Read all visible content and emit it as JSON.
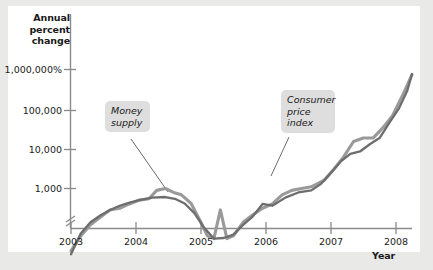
{
  "figure": {
    "background": "#e9e9e7",
    "plot_background": "#ffffff"
  },
  "chart_data": {
    "type": "line",
    "title": "",
    "xlabel": "Year",
    "ylabel": "Annual percent change",
    "y_scale": "log",
    "y_axis_break": true,
    "grid": false,
    "legend_position": "inline-callouts",
    "x_tick_labels": [
      "2003",
      "2004",
      "2005",
      "2006",
      "2007",
      "2008"
    ],
    "x_tick_values": [
      2003,
      2004,
      2005,
      2006,
      2007,
      2008
    ],
    "y_tick_labels": [
      "1,000,000%",
      "100,000",
      "10,000",
      "1,000"
    ],
    "y_tick_values": [
      1000000,
      100000,
      10000,
      1000
    ],
    "xlim": [
      2003,
      2008.25
    ],
    "ylim": [
      10,
      1000000
    ],
    "series": [
      {
        "name": "Money supply",
        "color": "#9a9a9a",
        "points": [
          [
            2003.0,
            30
          ],
          [
            2003.15,
            70
          ],
          [
            2003.3,
            130
          ],
          [
            2003.45,
            200
          ],
          [
            2003.6,
            300
          ],
          [
            2003.75,
            330
          ],
          [
            2003.9,
            420
          ],
          [
            2004.05,
            520
          ],
          [
            2004.2,
            560
          ],
          [
            2004.32,
            900
          ],
          [
            2004.45,
            1000
          ],
          [
            2004.58,
            800
          ],
          [
            2004.7,
            700
          ],
          [
            2004.85,
            430
          ],
          [
            2005.0,
            150
          ],
          [
            2005.1,
            70
          ],
          [
            2005.2,
            60
          ],
          [
            2005.3,
            300
          ],
          [
            2005.4,
            60
          ],
          [
            2005.5,
            70
          ],
          [
            2005.65,
            150
          ],
          [
            2005.8,
            230
          ],
          [
            2005.95,
            330
          ],
          [
            2006.1,
            420
          ],
          [
            2006.25,
            700
          ],
          [
            2006.4,
            900
          ],
          [
            2006.55,
            1000
          ],
          [
            2006.7,
            1100
          ],
          [
            2006.9,
            1600
          ],
          [
            2007.05,
            3000
          ],
          [
            2007.2,
            6000
          ],
          [
            2007.35,
            14000
          ],
          [
            2007.5,
            17000
          ],
          [
            2007.65,
            17000
          ],
          [
            2007.8,
            30000
          ],
          [
            2007.95,
            60000
          ],
          [
            2008.1,
            180000
          ],
          [
            2008.25,
            600000
          ]
        ]
      },
      {
        "name": "Consumer price index",
        "color": "#6d6d6d",
        "points": [
          [
            2003.0,
            25
          ],
          [
            2003.15,
            80
          ],
          [
            2003.3,
            150
          ],
          [
            2003.45,
            220
          ],
          [
            2003.6,
            300
          ],
          [
            2003.75,
            380
          ],
          [
            2003.9,
            450
          ],
          [
            2004.05,
            520
          ],
          [
            2004.25,
            600
          ],
          [
            2004.45,
            620
          ],
          [
            2004.6,
            560
          ],
          [
            2004.75,
            430
          ],
          [
            2004.9,
            250
          ],
          [
            2005.05,
            110
          ],
          [
            2005.2,
            60
          ],
          [
            2005.35,
            62
          ],
          [
            2005.5,
            75
          ],
          [
            2005.65,
            130
          ],
          [
            2005.8,
            210
          ],
          [
            2005.95,
            420
          ],
          [
            2006.1,
            380
          ],
          [
            2006.3,
            600
          ],
          [
            2006.5,
            800
          ],
          [
            2006.7,
            900
          ],
          [
            2006.85,
            1300
          ],
          [
            2007.0,
            2400
          ],
          [
            2007.15,
            4500
          ],
          [
            2007.3,
            7000
          ],
          [
            2007.45,
            8000
          ],
          [
            2007.6,
            12000
          ],
          [
            2007.75,
            17000
          ],
          [
            2007.9,
            40000
          ],
          [
            2008.05,
            90000
          ],
          [
            2008.18,
            250000
          ],
          [
            2008.25,
            620000
          ]
        ]
      }
    ],
    "annotations": [
      {
        "name": "money-supply-callout",
        "text": "Money\nsupply",
        "target_series": "Money supply"
      },
      {
        "name": "consumer-price-index-callout",
        "text": "Consumer\nprice\nindex",
        "target_series": "Consumer price index"
      }
    ]
  }
}
